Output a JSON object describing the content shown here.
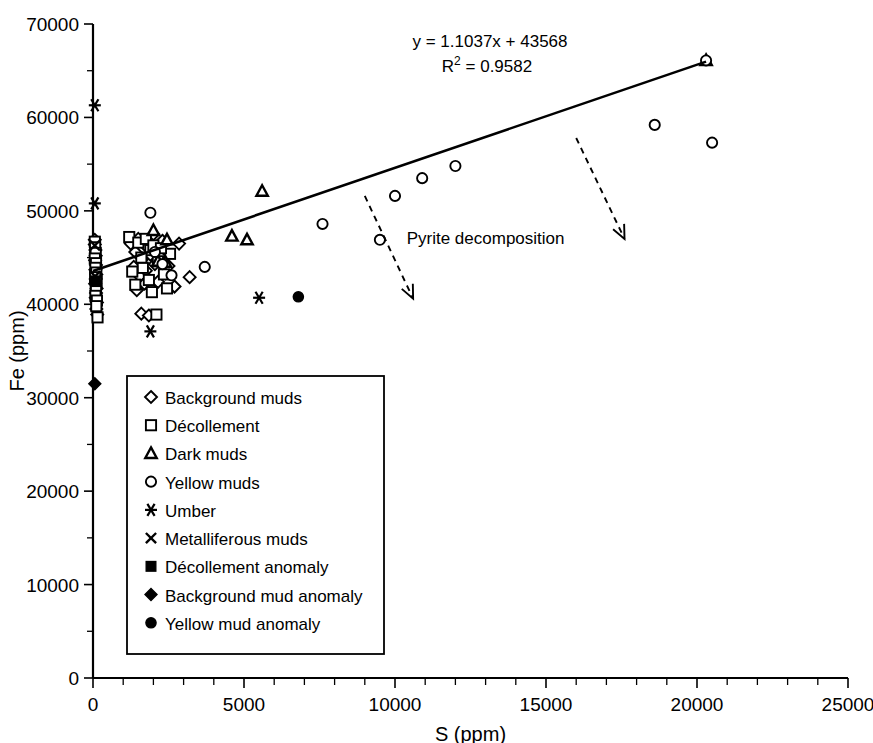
{
  "chart_data": {
    "type": "scatter",
    "title": "",
    "xlabel": "S (ppm)",
    "ylabel": "Fe (ppm)",
    "xlim": [
      0,
      25000
    ],
    "ylim": [
      0,
      70000
    ],
    "x_ticks": [
      0,
      5000,
      10000,
      15000,
      20000,
      25000
    ],
    "x_tick_labels": [
      "0",
      "5000",
      "10000",
      "15000",
      "20000",
      "25000"
    ],
    "y_ticks": [
      0,
      10000,
      20000,
      30000,
      40000,
      50000,
      60000,
      70000
    ],
    "y_tick_labels": [
      "0",
      "10000",
      "20000",
      "30000",
      "40000",
      "50000",
      "60000",
      "70000"
    ],
    "x_minor_step": 1000,
    "y_minor_step": 5000,
    "grid": false,
    "legend_position": "lower-left-inside",
    "trendline": {
      "equation": "y = 1.1037x + 43568",
      "r_squared_label": "R2 = 0.9582",
      "r_squared_base": "R",
      "r_squared_exp": "2",
      "r_squared_rest": " = 0.9582",
      "slope": 1.1037,
      "intercept": 43568,
      "r_squared": 0.9582,
      "x_start": 0,
      "x_end": 20300
    },
    "annotations": [
      {
        "text": "Pyrite decomposition",
        "x": 13000,
        "y": 46500,
        "arrows": [
          {
            "x1": 9000,
            "y1": 51600,
            "x2": 10600,
            "y2": 40600
          },
          {
            "x1": 16000,
            "y1": 57800,
            "x2": 17600,
            "y2": 47000
          }
        ]
      }
    ],
    "series": [
      {
        "name": "Background muds",
        "marker": "open-diamond",
        "points": [
          [
            60,
            46900
          ],
          [
            60,
            46400
          ],
          [
            80,
            45800
          ],
          [
            90,
            45200
          ],
          [
            70,
            44700
          ],
          [
            100,
            44200
          ],
          [
            80,
            43700
          ],
          [
            110,
            43200
          ],
          [
            90,
            42700
          ],
          [
            70,
            42200
          ],
          [
            120,
            41700
          ],
          [
            100,
            41200
          ],
          [
            90,
            40700
          ],
          [
            130,
            40200
          ],
          [
            110,
            39500
          ],
          [
            140,
            38900
          ],
          [
            1250,
            46500
          ],
          [
            1400,
            45600
          ],
          [
            1500,
            47000
          ],
          [
            1650,
            44900
          ],
          [
            1800,
            46100
          ],
          [
            1900,
            45300
          ],
          [
            2000,
            47500
          ],
          [
            1750,
            43600
          ],
          [
            1550,
            43000
          ],
          [
            2050,
            44300
          ],
          [
            2250,
            45000
          ],
          [
            2150,
            42400
          ],
          [
            1900,
            41800
          ],
          [
            2400,
            43300
          ],
          [
            1600,
            39000
          ],
          [
            1850,
            38800
          ],
          [
            2300,
            46800
          ],
          [
            2500,
            44100
          ],
          [
            3200,
            42900
          ],
          [
            2700,
            41900
          ],
          [
            1450,
            41500
          ],
          [
            1700,
            42200
          ],
          [
            2850,
            46500
          ],
          [
            1350,
            44000
          ]
        ]
      },
      {
        "name": "Décollement",
        "marker": "open-square",
        "points": [
          [
            60,
            46700
          ],
          [
            70,
            46100
          ],
          [
            90,
            45500
          ],
          [
            60,
            44900
          ],
          [
            100,
            44400
          ],
          [
            80,
            43900
          ],
          [
            110,
            43400
          ],
          [
            70,
            42900
          ],
          [
            120,
            42400
          ],
          [
            90,
            41900
          ],
          [
            100,
            41400
          ],
          [
            80,
            40900
          ],
          [
            130,
            40400
          ],
          [
            110,
            39800
          ],
          [
            150,
            38600
          ],
          [
            1200,
            47200
          ],
          [
            1500,
            46600
          ],
          [
            1750,
            47000
          ],
          [
            1900,
            45800
          ],
          [
            2000,
            46300
          ],
          [
            2150,
            44600
          ],
          [
            1650,
            43900
          ],
          [
            1850,
            42600
          ],
          [
            2350,
            43200
          ],
          [
            1400,
            42100
          ],
          [
            2450,
            41700
          ],
          [
            1950,
            41300
          ],
          [
            2100,
            38900
          ],
          [
            2550,
            45400
          ],
          [
            1600,
            45000
          ],
          [
            2250,
            46000
          ],
          [
            1300,
            43500
          ]
        ]
      },
      {
        "name": "Dark muds",
        "marker": "filled-triangle",
        "points": [
          [
            2000,
            47900
          ],
          [
            2450,
            46900
          ],
          [
            2150,
            44600
          ],
          [
            2400,
            44500
          ],
          [
            4600,
            47300
          ],
          [
            5100,
            46900
          ],
          [
            5600,
            52100
          ],
          [
            20300,
            66100
          ]
        ]
      },
      {
        "name": "Yellow muds",
        "marker": "open-circle",
        "points": [
          [
            1900,
            49800
          ],
          [
            2050,
            45600
          ],
          [
            2300,
            44300
          ],
          [
            2600,
            43100
          ],
          [
            3700,
            44000
          ],
          [
            7600,
            48600
          ],
          [
            9500,
            46900
          ],
          [
            10000,
            51600
          ],
          [
            10900,
            53500
          ],
          [
            12000,
            54800
          ],
          [
            18600,
            59200
          ],
          [
            20500,
            57300
          ],
          [
            20300,
            66100
          ]
        ]
      },
      {
        "name": "Umber",
        "marker": "star6",
        "points": [
          [
            60,
            61300
          ],
          [
            60,
            50800
          ],
          [
            1900,
            37100
          ],
          [
            5500,
            40700
          ]
        ]
      },
      {
        "name": "Metalliferous muds",
        "marker": "cross-x",
        "points": [
          [
            60,
            46300
          ],
          [
            70,
            43000
          ]
        ]
      },
      {
        "name": "Décollement anomaly",
        "marker": "filled-square",
        "points": [
          [
            80,
            42500
          ]
        ]
      },
      {
        "name": "Background mud anomaly",
        "marker": "filled-diamond",
        "points": [
          [
            60,
            31500
          ]
        ]
      },
      {
        "name": "Yellow mud anomaly",
        "marker": "filled-circle",
        "points": [
          [
            6800,
            40800
          ]
        ]
      }
    ],
    "legend_entries": [
      {
        "label": "Background muds",
        "marker": "open-diamond"
      },
      {
        "label": "Décollement",
        "marker": "open-square"
      },
      {
        "label": "Dark muds",
        "marker": "filled-triangle"
      },
      {
        "label": "Yellow muds",
        "marker": "open-circle"
      },
      {
        "label": "Umber",
        "marker": "star6"
      },
      {
        "label": "Metalliferous muds",
        "marker": "cross-x"
      },
      {
        "label": "Décollement anomaly",
        "marker": "filled-square"
      },
      {
        "label": "Background mud anomaly",
        "marker": "filled-diamond"
      },
      {
        "label": "Yellow mud anomaly",
        "marker": "filled-circle"
      }
    ]
  }
}
